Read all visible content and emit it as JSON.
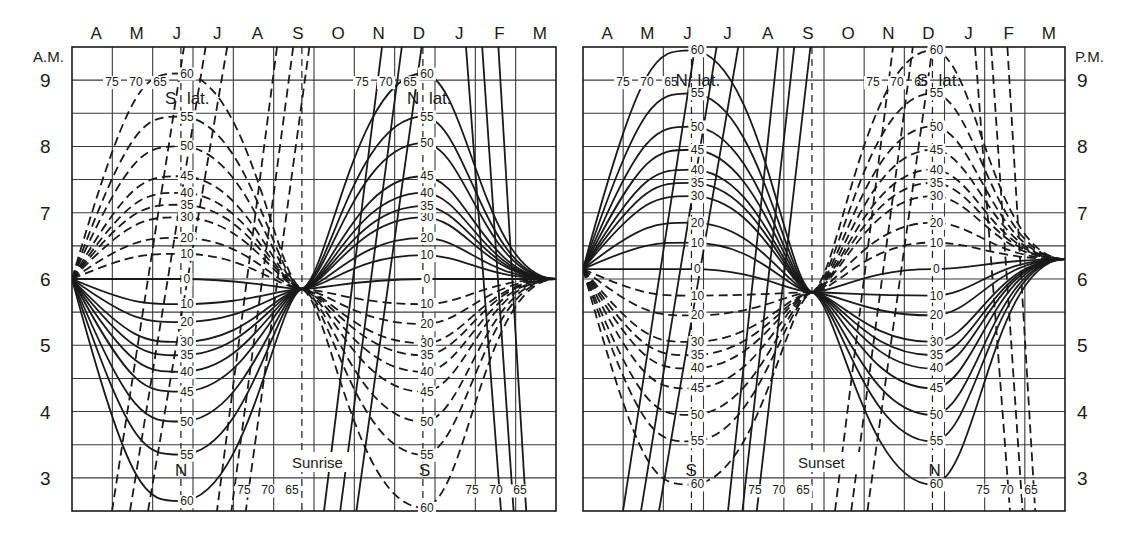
{
  "chart_data": [
    {
      "type": "line",
      "title": "Sunrise",
      "period_label": "A.M.",
      "x_ticks": [
        "A",
        "M",
        "J",
        "J",
        "A",
        "S",
        "O",
        "N",
        "D",
        "J",
        "F",
        "M"
      ],
      "y_ticks": [
        9,
        8,
        7,
        6,
        5,
        4,
        3
      ],
      "ylim": [
        2.5,
        9.5
      ],
      "ylabel": "A.M.",
      "xlabel": "",
      "grid": true,
      "equinox_line": "S",
      "solstice_lines": [
        "J",
        "D"
      ],
      "group_labels": [
        {
          "text": "S lat.",
          "near": "June, top"
        },
        {
          "text": "N lat.",
          "near": "December, top"
        },
        {
          "text": "N",
          "near": "June, bottom"
        },
        {
          "text": "S",
          "near": "December, bottom"
        }
      ],
      "series_labels_june": [
        "75",
        "70",
        "65",
        "60",
        "55",
        "50",
        "45",
        "40",
        "35",
        "30",
        "20",
        "10",
        "0",
        "10",
        "20",
        "30",
        "35",
        "40",
        "45",
        "50",
        "55",
        "60",
        "65",
        "70",
        "75"
      ],
      "series": [
        {
          "name": "0",
          "june": 6.0,
          "december": 6.0
        },
        {
          "name": "10 N",
          "june": 5.62,
          "december": 6.36
        },
        {
          "name": "20 N",
          "june": 5.35,
          "december": 6.62
        },
        {
          "name": "30 N",
          "june": 5.05,
          "december": 6.93
        },
        {
          "name": "35 N",
          "june": 4.85,
          "december": 7.1
        },
        {
          "name": "40 N",
          "june": 4.6,
          "december": 7.3
        },
        {
          "name": "45 N",
          "june": 4.3,
          "december": 7.55
        },
        {
          "name": "50 N",
          "june": 3.85,
          "december": 8.05
        },
        {
          "name": "55 N",
          "june": 3.35,
          "december": 8.45
        },
        {
          "name": "60 N",
          "june": 2.65,
          "december": 9.1
        },
        {
          "name": "10 S",
          "june": 6.38,
          "december": 5.62
        },
        {
          "name": "20 S",
          "june": 6.62,
          "december": 5.32
        },
        {
          "name": "30 S",
          "june": 6.93,
          "december": 5.03
        },
        {
          "name": "35 S",
          "june": 7.12,
          "december": 4.85
        },
        {
          "name": "40 S",
          "june": 7.3,
          "december": 4.6
        },
        {
          "name": "45 S",
          "june": 7.55,
          "december": 4.3
        },
        {
          "name": "50 S",
          "june": 8.0,
          "december": 3.85
        },
        {
          "name": "55 S",
          "june": 8.45,
          "december": 3.35
        },
        {
          "name": "60 S",
          "june": 9.1,
          "december": 2.55
        }
      ],
      "high_latitude_labels": [
        "75",
        "70",
        "65"
      ]
    },
    {
      "type": "line",
      "title": "Sunset",
      "period_label": "P.M.",
      "x_ticks": [
        "A",
        "M",
        "J",
        "J",
        "A",
        "S",
        "O",
        "N",
        "D",
        "J",
        "F",
        "M"
      ],
      "y_ticks": [
        9,
        8,
        7,
        6,
        5,
        4,
        3
      ],
      "ylim": [
        2.5,
        9.5
      ],
      "ylabel": "P.M.",
      "xlabel": "",
      "grid": true,
      "equinox_line": "S",
      "solstice_lines": [
        "J",
        "D"
      ],
      "group_labels": [
        {
          "text": "N lat.",
          "near": "June, top"
        },
        {
          "text": "S lat.",
          "near": "December, top"
        },
        {
          "text": "S",
          "near": "June, bottom"
        },
        {
          "text": "N",
          "near": "December, bottom"
        }
      ],
      "series": [
        {
          "name": "0",
          "june": 6.15,
          "december": 6.15
        },
        {
          "name": "10 N",
          "june": 6.55,
          "december": 5.75
        },
        {
          "name": "20 N",
          "june": 6.85,
          "december": 5.45
        },
        {
          "name": "30 N",
          "june": 7.25,
          "december": 5.05
        },
        {
          "name": "35 N",
          "june": 7.45,
          "december": 4.85
        },
        {
          "name": "40 N",
          "june": 7.65,
          "december": 4.65
        },
        {
          "name": "45 N",
          "june": 7.95,
          "december": 4.35
        },
        {
          "name": "50 N",
          "june": 8.3,
          "december": 3.95
        },
        {
          "name": "55 N",
          "june": 8.8,
          "december": 3.55
        },
        {
          "name": "60 N",
          "june": 9.45,
          "december": 2.9
        },
        {
          "name": "10 S",
          "june": 5.75,
          "december": 6.55
        },
        {
          "name": "20 S",
          "june": 5.45,
          "december": 6.85
        },
        {
          "name": "30 S",
          "june": 5.05,
          "december": 7.25
        },
        {
          "name": "35 S",
          "june": 4.85,
          "december": 7.45
        },
        {
          "name": "40 S",
          "june": 4.65,
          "december": 7.65
        },
        {
          "name": "45 S",
          "june": 4.35,
          "december": 7.95
        },
        {
          "name": "50 S",
          "june": 3.95,
          "december": 8.3
        },
        {
          "name": "55 S",
          "june": 3.55,
          "december": 8.8
        },
        {
          "name": "60 S",
          "june": 2.9,
          "december": 9.45
        }
      ],
      "high_latitude_labels": [
        "75",
        "70",
        "65"
      ]
    }
  ],
  "labels": {
    "left": {
      "ampm": "A.M.",
      "title": "Sunrise",
      "top_june_group": "S",
      "top_june_lat": "lat.",
      "top_dec_group": "N",
      "top_dec_lat": "lat.",
      "bottom_june": "N",
      "bottom_dec": "S"
    },
    "right": {
      "ampm": "P.M.",
      "title": "Sunset",
      "top_june_group": "N",
      "top_june_lat": "lat.",
      "top_dec_group": "S",
      "top_dec_lat": "lat.",
      "bottom_june": "S",
      "bottom_dec": "N"
    },
    "months": [
      "A",
      "M",
      "J",
      "J",
      "A",
      "S",
      "O",
      "N",
      "D",
      "J",
      "F",
      "M"
    ],
    "hours": [
      "9",
      "8",
      "7",
      "6",
      "5",
      "4",
      "3"
    ],
    "lat_top": [
      "75",
      "70",
      "65",
      "60",
      "55",
      "50",
      "45",
      "40",
      "35",
      "30",
      "20",
      "10",
      "0"
    ],
    "lat_bottom": [
      "10",
      "20",
      "30",
      "35",
      "40",
      "45",
      "50",
      "55",
      "60"
    ],
    "lat_edge": [
      "75",
      "70",
      "65"
    ]
  },
  "style": {
    "line_color": "#1a1a1a",
    "grid_color": "#3a3a3a",
    "background": "#ffffff"
  }
}
